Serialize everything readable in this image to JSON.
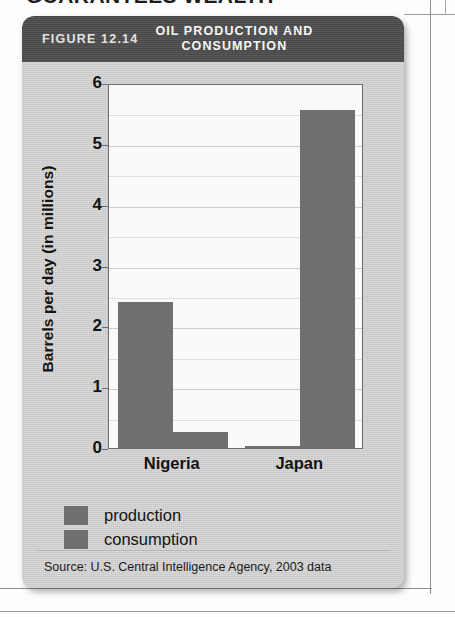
{
  "page": {
    "cropped_headline": "GUARANTEES WEALTH"
  },
  "figure": {
    "label": "FIGURE 12.14",
    "title_line1": "OIL PRODUCTION AND",
    "title_line2": "CONSUMPTION",
    "source": "Source: U.S. Central Intelligence Agency, 2003 data",
    "header_bg": "#4c4c4c",
    "card_bg": "#d2d2d2",
    "bar_color": "#6f6f6f"
  },
  "chart_data": {
    "type": "bar",
    "title": "OIL PRODUCTION AND CONSUMPTION",
    "categories": [
      "Nigeria",
      "Japan"
    ],
    "series": [
      {
        "name": "production",
        "values": [
          2.4,
          0.04
        ]
      },
      {
        "name": "consumption",
        "values": [
          0.27,
          5.55
        ]
      }
    ],
    "xlabel": "",
    "ylabel": "Barrels per day (in millions)",
    "ylim": [
      0,
      6
    ],
    "yticks": [
      0,
      1,
      2,
      3,
      4,
      5,
      6
    ],
    "ytick_labels": [
      "0",
      "1",
      "2",
      "3",
      "4",
      "5",
      "6"
    ],
    "minor_tick_step": 0.5,
    "grid": true,
    "legend_position": "below-plot-left",
    "legend": [
      "production",
      "consumption"
    ],
    "source": "Source: U.S. Central Intelligence Agency, 2003 data"
  }
}
